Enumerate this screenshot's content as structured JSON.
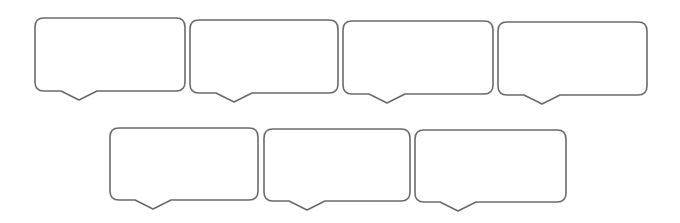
{
  "diagram": {
    "type": "speech-bubble-set",
    "colors": {
      "stroke": "#6b6b6b",
      "fill": "#ffffff",
      "background": "#ffffff"
    },
    "bubbles": [
      {
        "id": 1,
        "row": 1,
        "x": 35,
        "y": 18,
        "w": 150,
        "h": 73,
        "pointer_offset": 26,
        "pointer_tip": 44,
        "pointer_span": 36,
        "pointer_depth": 9,
        "text": ""
      },
      {
        "id": 2,
        "row": 1,
        "x": 190,
        "y": 20,
        "w": 148,
        "h": 73,
        "pointer_offset": 26,
        "pointer_tip": 44,
        "pointer_span": 36,
        "pointer_depth": 9,
        "text": ""
      },
      {
        "id": 3,
        "row": 1,
        "x": 343,
        "y": 21,
        "w": 150,
        "h": 73,
        "pointer_offset": 26,
        "pointer_tip": 44,
        "pointer_span": 36,
        "pointer_depth": 9,
        "text": ""
      },
      {
        "id": 4,
        "row": 1,
        "x": 498,
        "y": 22,
        "w": 149,
        "h": 73,
        "pointer_offset": 26,
        "pointer_tip": 44,
        "pointer_span": 36,
        "pointer_depth": 9,
        "text": ""
      },
      {
        "id": 5,
        "row": 2,
        "x": 110,
        "y": 128,
        "w": 148,
        "h": 72,
        "pointer_offset": 25,
        "pointer_tip": 43,
        "pointer_span": 36,
        "pointer_depth": 9,
        "text": ""
      },
      {
        "id": 6,
        "row": 2,
        "x": 264,
        "y": 129,
        "w": 146,
        "h": 72,
        "pointer_offset": 25,
        "pointer_tip": 43,
        "pointer_span": 36,
        "pointer_depth": 9,
        "text": ""
      },
      {
        "id": 7,
        "row": 2,
        "x": 415,
        "y": 130,
        "w": 151,
        "h": 72,
        "pointer_offset": 25,
        "pointer_tip": 43,
        "pointer_span": 36,
        "pointer_depth": 9,
        "text": ""
      }
    ],
    "corner_radius": 9
  }
}
